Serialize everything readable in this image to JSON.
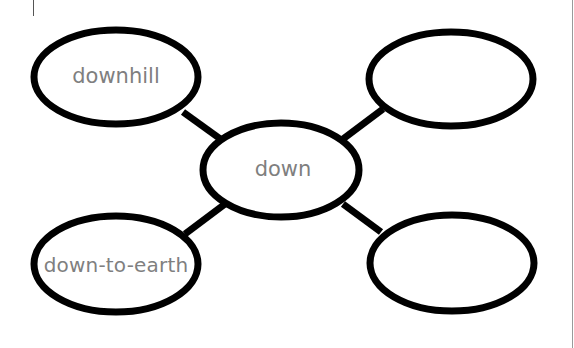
{
  "diagram": {
    "type": "word-web",
    "colors": {
      "stroke": "#000000",
      "text": "#7f7f7f",
      "background": "#ffffff"
    },
    "center": {
      "label": "down",
      "cx": 281,
      "cy": 170,
      "rx": 78,
      "ry": 47
    },
    "nodes": [
      {
        "id": "top-left",
        "label": "downhill",
        "cx": 116,
        "cy": 77,
        "rx": 82,
        "ry": 47
      },
      {
        "id": "top-right",
        "label": "",
        "cx": 451,
        "cy": 79,
        "rx": 82,
        "ry": 47
      },
      {
        "id": "bottom-left",
        "label": "down-to-earth",
        "cx": 116,
        "cy": 264,
        "rx": 82,
        "ry": 48
      },
      {
        "id": "bottom-right",
        "label": "",
        "cx": 452,
        "cy": 263,
        "rx": 82,
        "ry": 48
      }
    ]
  }
}
